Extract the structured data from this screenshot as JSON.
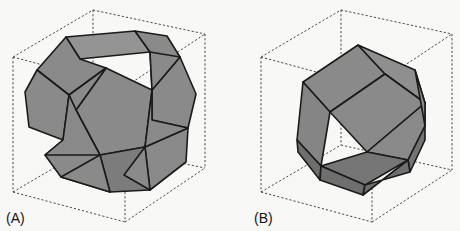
{
  "figure": {
    "width": 460,
    "height": 231,
    "background_color": "#f8f8f6"
  },
  "colors": {
    "background": "#f8f8f6",
    "face_fill": "#8a8a8a",
    "face_fill_light": "#949494",
    "face_fill_dark": "#7c7c7c",
    "face_fill_top": "#8f8f8f",
    "edge_stroke": "#1a1a1a",
    "cube_stroke": "#4a4a4a",
    "label_color": "#141414"
  },
  "panels": [
    {
      "id": "A",
      "label": "(A)",
      "label_x": 6,
      "label_y": 223,
      "shape_name": "pentagonal-dodecahedron",
      "cube": {
        "front_bottom_left": [
          13,
          192
        ],
        "front_bottom_right": [
          125,
          222
        ],
        "front_top_left": [
          13,
          57
        ],
        "front_top_right": [
          125,
          87
        ],
        "back_bottom_left": [
          93,
          145
        ],
        "back_bottom_right": [
          205,
          168
        ],
        "back_top_left": [
          93,
          10
        ],
        "back_top_right": [
          205,
          34
        ]
      },
      "solid_vertices": {
        "t1": [
          66,
          37
        ],
        "t2": [
          135,
          31
        ],
        "t3": [
          150,
          52
        ],
        "t4": [
          80,
          59
        ],
        "u1": [
          37,
          70
        ],
        "u2": [
          106,
          68
        ],
        "u3": [
          180,
          57
        ],
        "u4": [
          196,
          94
        ],
        "m1": [
          29,
          127
        ],
        "m2": [
          69,
          148
        ],
        "m3": [
          113,
          106
        ],
        "m4": [
          152,
          90
        ],
        "m5": [
          188,
          128
        ],
        "m6": [
          145,
          147
        ],
        "b1": [
          61,
          177
        ],
        "b2": [
          110,
          192
        ],
        "b3": [
          150,
          190
        ],
        "b4": [
          186,
          162
        ],
        "c": [
          122,
          148
        ]
      },
      "faces": [
        {
          "name": "top-face",
          "shade": "light",
          "points": "66,37 135,31 150,52 80,59"
        },
        {
          "name": "upper-left-face",
          "shade": "base",
          "points": "66,37 80,59 106,68 69,95 37,70"
        },
        {
          "name": "upper-right-face",
          "shade": "base",
          "points": "135,31 150,52 152,90 180,57 167,36"
        },
        {
          "name": "left-face",
          "shade": "base",
          "points": "37,70 69,95 63,140 29,127 25,92"
        },
        {
          "name": "center-face",
          "shade": "base",
          "points": "106,68 152,90 145,147 100,155 76,110"
        },
        {
          "name": "right-face",
          "shade": "base",
          "points": "180,57 196,94 188,128 152,120 152,90"
        },
        {
          "name": "lower-left-face",
          "shade": "base",
          "points": "63,140 100,155 110,192 61,177 45,155"
        },
        {
          "name": "lower-right-face",
          "shade": "base",
          "points": "145,147 188,128 186,162 150,190 124,175"
        },
        {
          "name": "bottom-face",
          "shade": "dark",
          "points": "100,155 145,147 150,190 110,192"
        }
      ]
    },
    {
      "id": "B",
      "label": "(B)",
      "label_x": 254,
      "label_y": 223,
      "shape_name": "rhombic-dodecahedron",
      "cube": {
        "front_bottom_left": [
          261,
          192
        ],
        "front_bottom_right": [
          372,
          222
        ],
        "front_top_left": [
          261,
          57
        ],
        "front_top_right": [
          372,
          87
        ],
        "back_bottom_left": [
          341,
          145
        ],
        "back_bottom_right": [
          452,
          170
        ],
        "back_top_left": [
          341,
          10
        ],
        "back_top_right": [
          452,
          34
        ]
      },
      "solid_vertices": {
        "apex": [
          358,
          45
        ],
        "nw": [
          303,
          82
        ],
        "ne": [
          415,
          70
        ],
        "w": [
          297,
          140
        ],
        "e": [
          425,
          126
        ],
        "cc": [
          370,
          110
        ],
        "cl": [
          330,
          95
        ],
        "cr": [
          405,
          100
        ],
        "sw": [
          320,
          172
        ],
        "se": [
          408,
          160
        ],
        "low": [
          365,
          185
        ]
      },
      "faces": [
        {
          "name": "top-left-rhombus",
          "shade": "base",
          "points": "358,45 303,82 330,112 385,74"
        },
        {
          "name": "top-right-rhombus",
          "shade": "base",
          "points": "358,45 385,74 425,103 415,70"
        },
        {
          "name": "center-left-rhombus",
          "shade": "base",
          "points": "303,82 330,112 321,166 297,140"
        },
        {
          "name": "center-front-rhombus",
          "shade": "base",
          "points": "330,112 385,74 425,103 367,152"
        },
        {
          "name": "center-right-rhombus",
          "shade": "base",
          "points": "425,103 425,126 408,160 367,152"
        },
        {
          "name": "lower-left-face",
          "shade": "dark",
          "points": "297,140 321,166 320,180 298,152"
        },
        {
          "name": "bottom-front-face",
          "shade": "dark",
          "points": "321,166 367,152 408,160 365,185"
        },
        {
          "name": "bottom-left-face",
          "shade": "dark",
          "points": "320,180 321,166 365,185 363,195"
        },
        {
          "name": "bottom-right-face",
          "shade": "dark",
          "points": "408,160 425,126 425,140 410,172"
        }
      ]
    }
  ]
}
